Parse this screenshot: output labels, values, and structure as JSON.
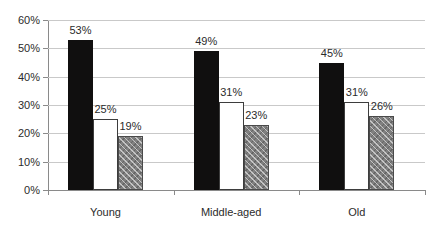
{
  "chart_data": {
    "type": "bar",
    "title": "",
    "subtitle": "",
    "xlabel": "",
    "ylabel": "",
    "categories": [
      "Young",
      "Middle-aged",
      "Old"
    ],
    "series": [
      {
        "name": "series-1",
        "fill": "solid-black",
        "values": [
          53,
          25,
          19
        ]
      },
      {
        "name": "series-2",
        "fill": "white-outline",
        "values": [
          49,
          31,
          23
        ]
      },
      {
        "name": "series-3",
        "fill": "gray-hatch",
        "values": [
          45,
          31,
          26
        ]
      }
    ],
    "grouped_values": [
      {
        "category": "Young",
        "bars": [
          53,
          25,
          19
        ]
      },
      {
        "category": "Middle-aged",
        "bars": [
          49,
          31,
          23
        ]
      },
      {
        "category": "Old",
        "bars": [
          45,
          31,
          26
        ]
      }
    ],
    "data_labels": [
      [
        "53%",
        "25%",
        "19%"
      ],
      [
        "49%",
        "31%",
        "23%"
      ],
      [
        "45%",
        "31%",
        "26%"
      ]
    ],
    "ylim": [
      0,
      60
    ],
    "ytick_values": [
      0,
      10,
      20,
      30,
      40,
      50,
      60
    ],
    "ytick_labels": [
      "0%",
      "10%",
      "20%",
      "30%",
      "40%",
      "50%",
      "60%"
    ],
    "grid": "horizontal",
    "legend": "none",
    "value_suffix": "%",
    "colors": {
      "bar_solid": "#100f0f",
      "bar_open_fill": "#ffffff",
      "bar_open_border": "#3d3d3d",
      "bar_hatch_base": "#808080",
      "bar_hatch_border": "#4a4a4a",
      "gridline": "#c9c9c9",
      "axis": "#8a8a8a",
      "text": "#2b2b2b",
      "background": "#ffffff"
    }
  }
}
